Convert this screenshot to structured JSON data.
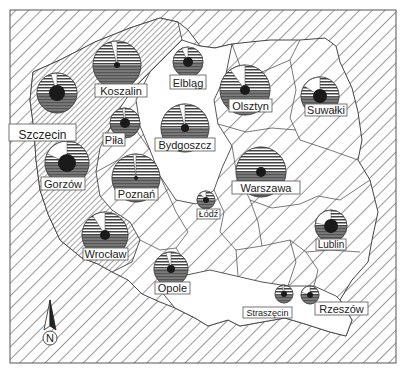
{
  "map": {
    "width": 402,
    "height": 368,
    "frame": {
      "x": 10,
      "y": 10,
      "w": 386,
      "h": 353
    },
    "colors": {
      "background": "#ffffff",
      "hatch": "#333333",
      "border": "#555555",
      "pie_stripe": "#444444",
      "pie_dark": "#6a6a6a",
      "pie_center": "#1a1a1a",
      "label_box": "#ffffff"
    },
    "compass": {
      "label": "N",
      "icon": "north-arrow-icon",
      "x": 50,
      "y": 330
    }
  },
  "chart_data": {
    "type": "map-pie-symbols",
    "title": "",
    "legend": [],
    "slice_categories": [
      "white-sector",
      "horizontal-striped-sector",
      "gray-sector"
    ],
    "regions": [
      {
        "name": "Szczecin",
        "cx": 57,
        "cy": 93,
        "r": 20,
        "white_pct": 5,
        "striped_pct": 45,
        "gray_pct": 50,
        "center_r": 8,
        "label": {
          "x": 9,
          "y": 124,
          "w": 67,
          "h": 17,
          "size": 12
        }
      },
      {
        "name": "Koszalin",
        "cx": 117,
        "cy": 65,
        "r": 24,
        "white_pct": 4,
        "striped_pct": 46,
        "gray_pct": 50,
        "center_r": 3,
        "label": {
          "x": 95,
          "y": 84,
          "w": 52,
          "h": 13,
          "size": 11
        }
      },
      {
        "name": "Elbląg",
        "cx": 188,
        "cy": 62,
        "r": 15,
        "white_pct": 7,
        "striped_pct": 43,
        "gray_pct": 50,
        "center_r": 5,
        "label": {
          "x": 170,
          "y": 75,
          "w": 36,
          "h": 14,
          "size": 11
        }
      },
      {
        "name": "Olsztyn",
        "cx": 245,
        "cy": 90,
        "r": 25,
        "white_pct": 10,
        "striped_pct": 40,
        "gray_pct": 50,
        "center_r": 5,
        "label": {
          "x": 229,
          "y": 99,
          "w": 43,
          "h": 13,
          "size": 11
        }
      },
      {
        "name": "Suwałki",
        "cx": 320,
        "cy": 96,
        "r": 19,
        "white_pct": 16,
        "striped_pct": 34,
        "gray_pct": 50,
        "center_r": 7,
        "label": {
          "x": 305,
          "y": 104,
          "w": 42,
          "h": 12,
          "size": 11
        }
      },
      {
        "name": "Piła",
        "cx": 125,
        "cy": 123,
        "r": 15,
        "white_pct": 3,
        "striped_pct": 47,
        "gray_pct": 50,
        "center_r": 5,
        "label": {
          "x": 103,
          "y": 133,
          "w": 22,
          "h": 13,
          "size": 11
        }
      },
      {
        "name": "Bydgoszcz",
        "cx": 185,
        "cy": 128,
        "r": 24,
        "white_pct": 4,
        "striped_pct": 46,
        "gray_pct": 50,
        "center_r": 4,
        "label": {
          "x": 155,
          "y": 138,
          "w": 60,
          "h": 13,
          "size": 11
        }
      },
      {
        "name": "Gorzów",
        "cx": 67,
        "cy": 163,
        "r": 22,
        "white_pct": 18,
        "striped_pct": 32,
        "gray_pct": 50,
        "center_r": 9,
        "label": {
          "x": 41,
          "y": 177,
          "w": 44,
          "h": 13,
          "size": 11
        }
      },
      {
        "name": "Poznań",
        "cx": 136,
        "cy": 178,
        "r": 24,
        "white_pct": 2,
        "striped_pct": 48,
        "gray_pct": 50,
        "center_r": 2,
        "label": {
          "x": 115,
          "y": 188,
          "w": 43,
          "h": 12,
          "size": 11
        }
      },
      {
        "name": "Warszawa",
        "cx": 261,
        "cy": 172,
        "r": 25,
        "white_pct": 0,
        "striped_pct": 50,
        "gray_pct": 50,
        "center_r": 5,
        "label": {
          "x": 232,
          "y": 181,
          "w": 68,
          "h": 13,
          "size": 11
        }
      },
      {
        "name": "Łódź",
        "cx": 206,
        "cy": 200,
        "r": 9,
        "white_pct": 12,
        "striped_pct": 38,
        "gray_pct": 50,
        "center_r": 3,
        "label": {
          "x": 197,
          "y": 209,
          "w": 23,
          "h": 10,
          "size": 9
        }
      },
      {
        "name": "Wrocław",
        "cx": 105,
        "cy": 235,
        "r": 23,
        "white_pct": 9,
        "striped_pct": 41,
        "gray_pct": 50,
        "center_r": 5,
        "label": {
          "x": 83,
          "y": 248,
          "w": 45,
          "h": 12,
          "size": 11
        }
      },
      {
        "name": "Opole",
        "cx": 171,
        "cy": 269,
        "r": 17,
        "white_pct": 5,
        "striped_pct": 45,
        "gray_pct": 50,
        "center_r": 4,
        "label": {
          "x": 155,
          "y": 282,
          "w": 35,
          "h": 12,
          "size": 11
        }
      },
      {
        "name": "Lublin",
        "cx": 331,
        "cy": 226,
        "r": 16,
        "white_pct": 22,
        "striped_pct": 28,
        "gray_pct": 50,
        "center_r": 7,
        "label": {
          "x": 316,
          "y": 239,
          "w": 30,
          "h": 11,
          "size": 10
        }
      },
      {
        "name": "Straszęcin",
        "cx": 284,
        "cy": 294,
        "r": 9,
        "white_pct": 4,
        "striped_pct": 46,
        "gray_pct": 50,
        "center_r": 3,
        "label": {
          "x": 243,
          "y": 307,
          "w": 49,
          "h": 11,
          "size": 9
        }
      },
      {
        "name": "Rzeszów",
        "cx": 310,
        "cy": 295,
        "r": 9,
        "white_pct": 20,
        "striped_pct": 30,
        "gray_pct": 50,
        "center_r": 3,
        "label": {
          "x": 315,
          "y": 302,
          "w": 53,
          "h": 13,
          "size": 11
        }
      }
    ]
  }
}
